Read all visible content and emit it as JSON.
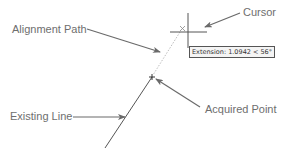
{
  "diagram": {
    "labels": {
      "alignment_path": "Alignment Path",
      "cursor": "Cursor",
      "existing_line": "Existing Line",
      "acquired_point": "Acquired Point"
    },
    "tooltip": {
      "text": "Extension: 1.0942 < 56°"
    },
    "colors": {
      "label_text": "#6e6e6e",
      "arrow": "#6a6a6a",
      "line": "#555555",
      "dotted_path": "#bdbdbd",
      "tooltip_border": "#555555",
      "tooltip_bg": "#f4f4f4"
    },
    "icons": {
      "cursor": "crosshair",
      "alignment_marker": "x-marker",
      "acquired_point": "plus-marker"
    }
  }
}
